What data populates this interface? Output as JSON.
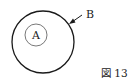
{
  "diagram": {
    "inner_circle_label": "A",
    "outer_circle_label": "B",
    "caption": "図 13"
  },
  "colors": {
    "stroke": "#1a1a1a",
    "inner_stroke": "#555555",
    "background": "#ffffff"
  }
}
